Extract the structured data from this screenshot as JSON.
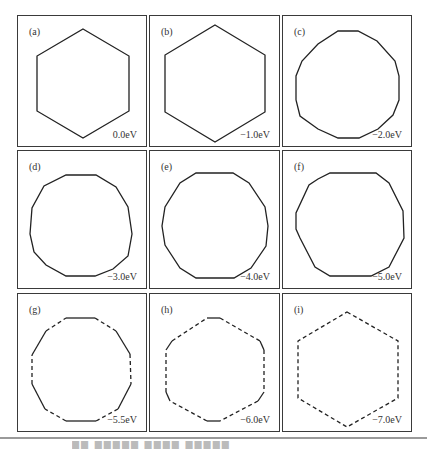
{
  "figure": {
    "stroke_color": "#222222",
    "frame_color": "#3a3a3a",
    "panels": [
      {
        "label": "(a)",
        "energy": "0.0eV",
        "style": "solid",
        "sides": 6
      },
      {
        "label": "(b)",
        "energy": "−1.0eV",
        "style": "solid",
        "sides": 6
      },
      {
        "label": "(c)",
        "energy": "−2.0eV",
        "style": "solid",
        "sides": 12
      },
      {
        "label": "(d)",
        "energy": "−3.0eV",
        "style": "solid",
        "sides": 12
      },
      {
        "label": "(e)",
        "energy": "−4.0eV",
        "style": "solid",
        "sides": 12
      },
      {
        "label": "(f)",
        "energy": "−5.0eV",
        "style": "solid",
        "sides": 12
      },
      {
        "label": "(g)",
        "energy": "−5.5eV",
        "style": "mixed",
        "sides": 12
      },
      {
        "label": "(h)",
        "energy": "−6.0eV",
        "style": "mixed",
        "sides": 12
      },
      {
        "label": "(i)",
        "energy": "−7.0eV",
        "style": "dashed",
        "sides": 6
      }
    ]
  },
  "caption": "██ █████ ████ █████"
}
